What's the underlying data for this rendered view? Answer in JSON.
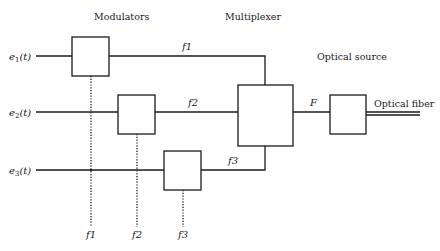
{
  "diagram": {
    "headings": {
      "modulators": "Modulators",
      "multiplexer": "Multiplexer",
      "optical_source": "Optical source",
      "optical_fiber": "Optical fiber"
    },
    "inputs": [
      {
        "base": "e",
        "sub": "1",
        "arg": "(t)"
      },
      {
        "base": "e",
        "sub": "2",
        "arg": "(t)"
      },
      {
        "base": "e",
        "sub": "3",
        "arg": "(t)"
      }
    ],
    "channel_labels": [
      "f1",
      "f2",
      "f3"
    ],
    "carrier_labels": [
      "f1",
      "f2",
      "f3"
    ],
    "combined_label": "F"
  }
}
